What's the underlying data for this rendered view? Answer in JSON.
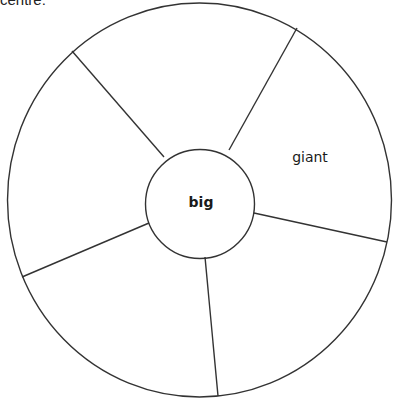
{
  "caption": "centre:",
  "diagram": {
    "type": "concept-wheel",
    "center_label": "big",
    "segments": [
      {
        "position": "top",
        "label": ""
      },
      {
        "position": "upper-right",
        "label": "giant"
      },
      {
        "position": "lower-right",
        "label": ""
      },
      {
        "position": "bottom",
        "label": ""
      },
      {
        "position": "left",
        "label": ""
      }
    ],
    "colors": {
      "stroke": "#333333",
      "background": "#ffffff"
    }
  }
}
